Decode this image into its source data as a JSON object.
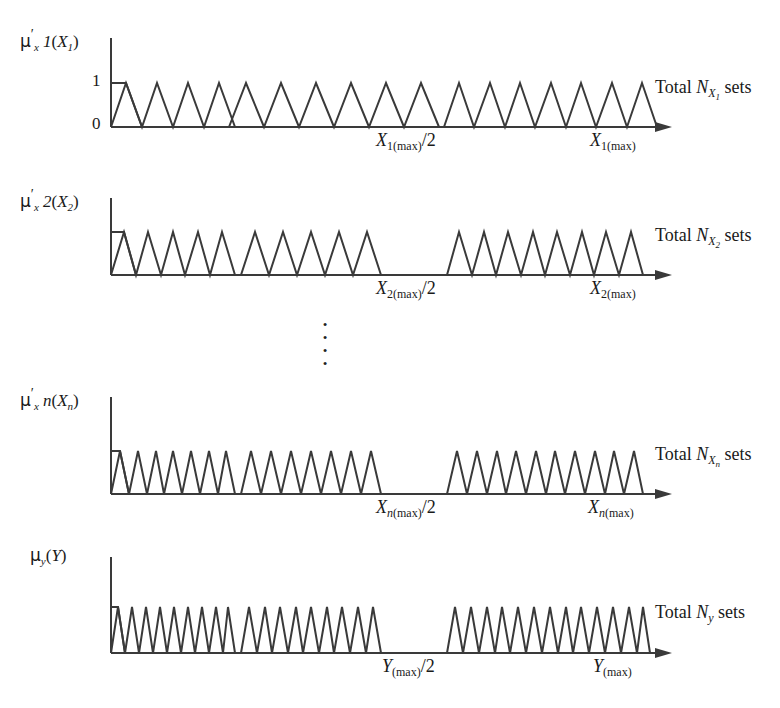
{
  "figure": {
    "type": "diagram",
    "stroke_color": "#3a3a3a",
    "background": "#ffffff"
  },
  "rows": [
    {
      "id": "row-x1",
      "y_axis_label_parts": {
        "mu": "μ",
        "sub": "x",
        "index": "1",
        "prime": "′",
        "arg_open": "(",
        "arg_var": "X",
        "arg_index": "1",
        "arg_close": ")"
      },
      "y_axis_label_plain": "μ′x1(X1)",
      "y_ticks": [
        "1",
        "0"
      ],
      "mid_tick_label_plain": "X1(max)/2",
      "mid_tick": {
        "var": "X",
        "sub": "1(max)",
        "suffix": "/2"
      },
      "end_tick_label_plain": "X1(max)",
      "end_tick": {
        "var": "X",
        "sub": "1(max)",
        "suffix": ""
      },
      "total_label_plain": "Total NX1 sets",
      "total_label": {
        "prefix": "Total",
        "symbol": "N",
        "sub": "X",
        "sub2": "1",
        "suffix": "sets"
      },
      "groups": [
        {
          "start": 111,
          "triangles": 4,
          "shoulder": true,
          "width": 124
        },
        {
          "start": 229,
          "triangles": 7,
          "shoulder": false,
          "width": 122
        },
        {
          "start": 444,
          "triangles": 10,
          "shoulder": false,
          "width": 168
        }
      ]
    },
    {
      "id": "row-x2",
      "y_axis_label_parts": {
        "mu": "μ",
        "sub": "x",
        "index": "2",
        "prime": "′",
        "arg_open": "(",
        "arg_var": "X",
        "arg_index": "2",
        "arg_close": ")"
      },
      "y_axis_label_plain": "μ′x2(X2)",
      "y_ticks": [],
      "mid_tick_label_plain": "X2(max)/2",
      "mid_tick": {
        "var": "X",
        "sub": "2(max)",
        "suffix": "/2"
      },
      "end_tick_label_plain": "X2(max)",
      "end_tick": {
        "var": "X",
        "sub": "2(max)",
        "suffix": ""
      },
      "total_label_plain": "Total NX2 sets",
      "total_label": {
        "prefix": "Total",
        "symbol": "N",
        "sub": "X",
        "sub2": "2",
        "suffix": "sets"
      },
      "groups": [
        {
          "start": 111,
          "triangles": 5,
          "shoulder": true,
          "width": 124
        },
        {
          "start": 241,
          "triangles": 9,
          "shoulder": false,
          "width": 126
        },
        {
          "start": 447,
          "triangles": 13,
          "shoulder": false,
          "width": 165
        }
      ]
    },
    {
      "id": "row-xn",
      "y_axis_label_parts": {
        "mu": "μ",
        "sub": "x",
        "index": "n",
        "prime": "′",
        "arg_open": "(",
        "arg_var": "X",
        "arg_index": "n",
        "arg_close": ")"
      },
      "y_axis_label_plain": "μ′xn(Xn)",
      "y_ticks": [],
      "mid_tick_label_plain": "Xn(max)/2",
      "mid_tick": {
        "var": "X",
        "sub": "n(max)",
        "suffix": "/2"
      },
      "end_tick_label_plain": "Xn(max)",
      "end_tick": {
        "var": "X",
        "sub": "n(max)",
        "suffix": ""
      },
      "total_label_plain": "Total NXn sets",
      "total_label": {
        "prefix": "Total",
        "symbol": "N",
        "sub": "X",
        "sub2": "n",
        "suffix": "sets"
      },
      "groups": [
        {
          "start": 111,
          "triangles": 7,
          "shoulder": true,
          "width": 124
        },
        {
          "start": 241,
          "triangles": 12,
          "shoulder": false,
          "width": 126
        },
        {
          "start": 447,
          "triangles": 16,
          "shoulder": false,
          "width": 165
        }
      ]
    },
    {
      "id": "row-y",
      "y_axis_label_parts": {
        "mu": "μ",
        "sub": "y",
        "index": "",
        "prime": "",
        "arg_open": "(",
        "arg_var": "Y",
        "arg_index": "",
        "arg_close": ")"
      },
      "y_axis_label_plain": "μy(Y)",
      "y_ticks": [],
      "mid_tick_label_plain": "Y(max)/2",
      "mid_tick": {
        "var": "Y",
        "sub": "(max)",
        "suffix": "/2"
      },
      "end_tick_label_plain": "Y(max)",
      "end_tick": {
        "var": "Y",
        "sub": "(max)",
        "suffix": ""
      },
      "total_label_plain": "Total Ny sets",
      "total_label": {
        "prefix": "Total",
        "symbol": "N",
        "sub": "y",
        "sub2": "",
        "suffix": "sets"
      },
      "groups": [
        {
          "start": 111,
          "triangles": 9,
          "shoulder": true,
          "width": 124
        },
        {
          "start": 241,
          "triangles": 15,
          "shoulder": false,
          "width": 126
        },
        {
          "start": 447,
          "triangles": 20,
          "shoulder": false,
          "width": 165
        }
      ]
    }
  ],
  "ellipsis": {
    "dots": 4,
    "symbol": "·"
  }
}
